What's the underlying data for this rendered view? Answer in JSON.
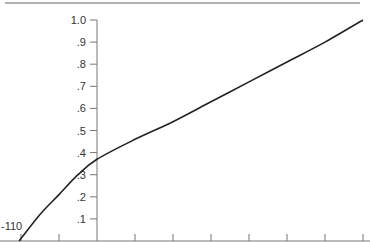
{
  "chart_data": {
    "type": "line",
    "title": "",
    "xlabel": "",
    "ylabel": "",
    "ylim": [
      0,
      1.0
    ],
    "xlim": [
      -2.05,
      7
    ],
    "grid": false,
    "legend": null,
    "y_ticks": [
      "1.0",
      ".9",
      ".8",
      ".7",
      ".6",
      ".5",
      ".4",
      ".3",
      ".2",
      ".1"
    ],
    "y_tick_values": [
      1.0,
      0.9,
      0.8,
      0.7,
      0.6,
      0.5,
      0.4,
      0.3,
      0.2,
      0.1
    ],
    "x_tick_positions": [
      -2,
      -1,
      0,
      1,
      2,
      3,
      4,
      5,
      6,
      7
    ],
    "x_tick_labels": [],
    "annotations": [
      {
        "text": "-110",
        "x": -2.05,
        "y": 0
      }
    ],
    "series": [
      {
        "name": "curve",
        "color": "#222222",
        "x": [
          -2.05,
          -1.5,
          -1,
          -0.5,
          0,
          1,
          2,
          3,
          4,
          5,
          6,
          7
        ],
        "y": [
          0.0,
          0.12,
          0.21,
          0.3,
          0.37,
          0.46,
          0.54,
          0.63,
          0.72,
          0.81,
          0.9,
          1.0
        ]
      }
    ]
  },
  "colors": {
    "axis": "#777777",
    "curve": "#222222",
    "top_rule": "#666666",
    "text": "#333333"
  }
}
